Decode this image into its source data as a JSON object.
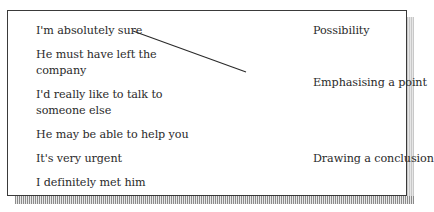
{
  "exercise": {
    "phrases": [
      {
        "line1": "I'm absolutely sure",
        "line2": ""
      },
      {
        "line1": "He must have left the",
        "line2": "company"
      },
      {
        "line1": "I'd really like to talk to",
        "line2": "someone else"
      },
      {
        "line1": "He may be able to help you",
        "line2": ""
      },
      {
        "line1": "It's very urgent",
        "line2": ""
      },
      {
        "line1": "I definitely met him",
        "line2": ""
      }
    ],
    "functions": [
      {
        "label": "Possibility"
      },
      {
        "label": "Emphasising a point"
      },
      {
        "label": "Drawing a conclusion"
      }
    ],
    "matches": [
      {
        "phrase": "I'm absolutely sure",
        "function": "Emphasising a point"
      }
    ]
  },
  "colors": {
    "border": "#3a3a3a",
    "text": "#2a2a2a",
    "shadow": "#c8c8c8"
  }
}
